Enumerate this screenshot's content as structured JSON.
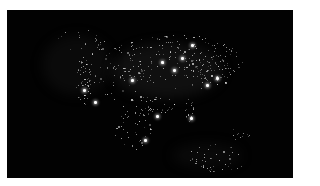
{
  "image": {
    "alt": "Night-time satellite view of North America showing city lights",
    "background": "#020202",
    "border_color": "#ffffff",
    "light_color": "#ffffff"
  },
  "haze": [
    {
      "x": 160,
      "y": 60,
      "w": 110,
      "h": 55,
      "c": "rgba(60,60,60,0.25)"
    },
    {
      "x": 70,
      "y": 55,
      "w": 70,
      "h": 60,
      "c": "rgba(45,45,45,0.2)"
    },
    {
      "x": 200,
      "y": 145,
      "w": 70,
      "h": 25,
      "c": "rgba(40,40,40,0.2)"
    }
  ],
  "clusters": [
    {
      "x": 168,
      "y": 52,
      "rx": 70,
      "ry": 28,
      "n": 170
    },
    {
      "x": 105,
      "y": 60,
      "rx": 35,
      "ry": 30,
      "n": 70
    },
    {
      "x": 76,
      "y": 70,
      "rx": 8,
      "ry": 25,
      "n": 40
    },
    {
      "x": 205,
      "y": 60,
      "rx": 22,
      "ry": 16,
      "n": 60
    },
    {
      "x": 140,
      "y": 95,
      "rx": 30,
      "ry": 10,
      "n": 45
    },
    {
      "x": 183,
      "y": 100,
      "rx": 5,
      "ry": 12,
      "n": 18
    },
    {
      "x": 125,
      "y": 120,
      "rx": 20,
      "ry": 20,
      "n": 40
    },
    {
      "x": 210,
      "y": 148,
      "rx": 30,
      "ry": 15,
      "n": 45
    },
    {
      "x": 230,
      "y": 125,
      "rx": 15,
      "ry": 6,
      "n": 12
    },
    {
      "x": 80,
      "y": 30,
      "rx": 30,
      "ry": 12,
      "n": 18
    }
  ],
  "bright_spots": [
    {
      "x": 167,
      "y": 60
    },
    {
      "x": 155,
      "y": 52
    },
    {
      "x": 200,
      "y": 75
    },
    {
      "x": 210,
      "y": 68
    },
    {
      "x": 88,
      "y": 92
    },
    {
      "x": 77,
      "y": 80
    },
    {
      "x": 150,
      "y": 106
    },
    {
      "x": 184,
      "y": 108
    },
    {
      "x": 138,
      "y": 130
    },
    {
      "x": 175,
      "y": 48
    },
    {
      "x": 125,
      "y": 70
    },
    {
      "x": 185,
      "y": 35
    }
  ]
}
